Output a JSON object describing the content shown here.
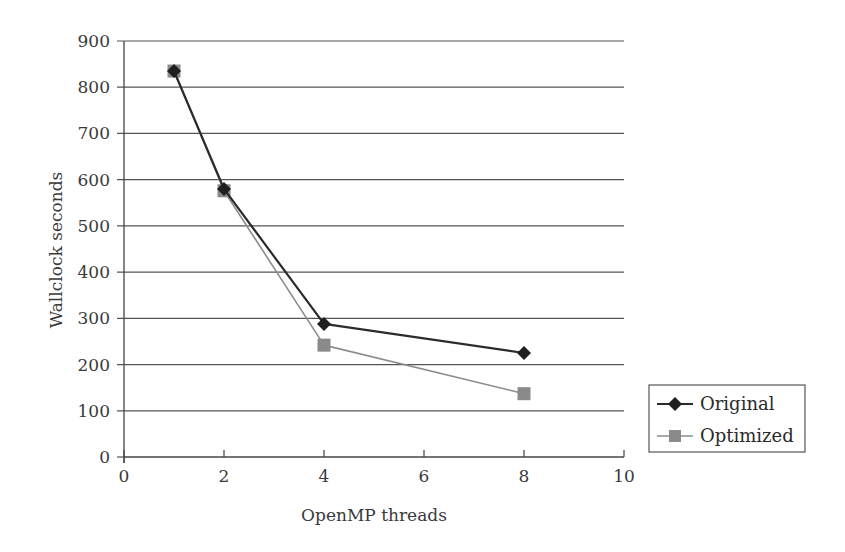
{
  "chart_data": {
    "type": "line",
    "title": "",
    "xlabel": "OpenMP threads",
    "ylabel": "Wallclock seconds",
    "xlim": [
      0,
      10
    ],
    "ylim": [
      0,
      900
    ],
    "x_ticks": [
      0,
      2,
      4,
      6,
      8,
      10
    ],
    "y_ticks": [
      0,
      100,
      200,
      300,
      400,
      500,
      600,
      700,
      800,
      900
    ],
    "grid": {
      "horizontal": true,
      "vertical": false
    },
    "legend_position": "right-bottom, outside plot area",
    "series": [
      {
        "name": "Original",
        "marker": "diamond",
        "color": "#2b2b2b",
        "x": [
          1,
          2,
          4,
          8
        ],
        "values": [
          835,
          580,
          288,
          225
        ]
      },
      {
        "name": "Optimized",
        "marker": "square",
        "color": "#8c8c8c",
        "x": [
          1,
          2,
          4,
          8
        ],
        "values": [
          835,
          576,
          242,
          137
        ]
      }
    ]
  },
  "axes": {
    "x_title": "OpenMP threads",
    "y_title": "Wallclock seconds"
  },
  "legend": {
    "items": [
      {
        "label": "Original"
      },
      {
        "label": "Optimized"
      }
    ]
  }
}
